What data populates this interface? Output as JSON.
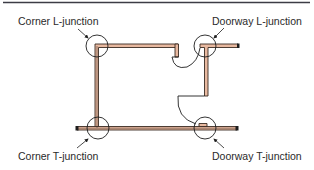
{
  "diagram": {
    "type": "floor-plan-wall-junctions",
    "colors": {
      "wall_fill": "#e8b9a0",
      "wall_outline": "#3a2a22",
      "line": "#1e1e1e",
      "rule": "#3c3c46",
      "text": "#2a2a2a"
    },
    "labels": {
      "corner_l": "Corner L-junction",
      "doorway_l": "Doorway L-junction",
      "corner_t": "Corner T-junction",
      "doorway_t": "Doorway T-junction"
    },
    "junctions": [
      {
        "name": "Corner L-junction",
        "cx": 97,
        "cy": 46,
        "r": 11
      },
      {
        "name": "Doorway L-junction",
        "cx": 205,
        "cy": 46,
        "r": 11
      },
      {
        "name": "Corner T-junction",
        "cx": 98,
        "cy": 128,
        "r": 11
      },
      {
        "name": "Doorway T-junction",
        "cx": 205,
        "cy": 128,
        "r": 11
      }
    ]
  }
}
